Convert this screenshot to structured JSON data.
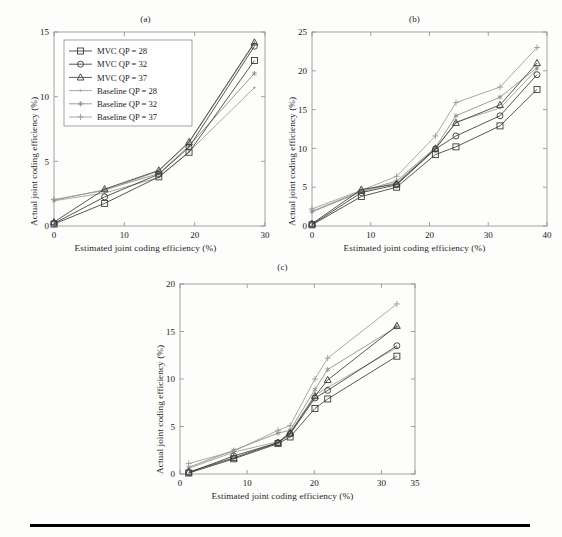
{
  "figure": {
    "background": "#fdfdfc",
    "axis_color": "#8c8c8c",
    "text_color": "#1f1f1f",
    "rule_color": "#000000"
  },
  "series_style": {
    "mvc_color": "#3a3a3a",
    "baseline_color": "#9a9a9a",
    "marker_colors": {
      "square": "#3a3a3a",
      "circle": "#3a3a3a",
      "triangle": "#3a3a3a",
      "dot": "#9a9a9a",
      "asterisk": "#8a8a8a",
      "plus": "#9a9a9a"
    }
  },
  "legend": {
    "position": "upper-left",
    "entries": [
      {
        "label": "MVC QP = 28",
        "marker": "square",
        "color": "#3a3a3a"
      },
      {
        "label": "MVC QP = 32",
        "marker": "circle",
        "color": "#3a3a3a"
      },
      {
        "label": "MVC QP = 37",
        "marker": "triangle",
        "color": "#3a3a3a"
      },
      {
        "label": "Baseline QP = 28",
        "marker": "dot",
        "color": "#9a9a9a"
      },
      {
        "label": "Baseline QP = 32",
        "marker": "asterisk",
        "color": "#8a8a8a"
      },
      {
        "label": "Baseline QP = 37",
        "marker": "plus",
        "color": "#9a9a9a"
      }
    ]
  },
  "chart_data": [
    {
      "type": "line",
      "id": "panel-a",
      "title": "(a)",
      "xlabel": "Estimated joint coding efficiency (%)",
      "ylabel": "Actual joint coding efficiency (%)",
      "xlim": [
        0,
        30
      ],
      "ylim": [
        0,
        15
      ],
      "xticks": [
        0,
        10,
        20,
        30
      ],
      "yticks": [
        0,
        5,
        10,
        15
      ],
      "grid": false,
      "legend": true,
      "series": [
        {
          "name": "MVC QP = 28",
          "marker": "square",
          "color": "#3a3a3a",
          "x": [
            0,
            7.2,
            14.9,
            19.2,
            28.5
          ],
          "y": [
            0.15,
            1.75,
            3.8,
            5.7,
            12.8
          ]
        },
        {
          "name": "MVC QP = 32",
          "marker": "circle",
          "color": "#3a3a3a",
          "x": [
            0,
            7.2,
            14.9,
            19.2,
            28.5
          ],
          "y": [
            0.2,
            2.25,
            4.0,
            6.1,
            13.9
          ]
        },
        {
          "name": "MVC QP = 37",
          "marker": "triangle",
          "color": "#3a3a3a",
          "x": [
            0,
            7.2,
            14.9,
            19.2,
            28.5
          ],
          "y": [
            0.3,
            2.85,
            4.3,
            6.5,
            14.2
          ]
        },
        {
          "name": "Baseline QP = 28",
          "marker": "dot",
          "color": "#9a9a9a",
          "x": [
            0,
            7.2,
            14.9,
            19.2,
            28.5
          ],
          "y": [
            1.95,
            2.55,
            3.75,
            5.75,
            10.7
          ]
        },
        {
          "name": "Baseline QP = 32",
          "marker": "asterisk",
          "color": "#8a8a8a",
          "x": [
            0,
            7.2,
            14.9,
            19.2,
            28.5
          ],
          "y": [
            2.0,
            2.8,
            4.05,
            6.2,
            11.8
          ]
        },
        {
          "name": "Baseline QP = 37",
          "marker": "plus",
          "color": "#9a9a9a",
          "x": [
            0,
            7.2,
            14.9,
            19.2,
            28.5
          ],
          "y": [
            2.05,
            2.75,
            4.25,
            6.45,
            14.1
          ]
        }
      ]
    },
    {
      "type": "line",
      "id": "panel-b",
      "title": "(b)",
      "xlabel": "Estimated joint coding efficiency (%)",
      "ylabel": "Actual joint coding efficiency (%)",
      "xlim": [
        0,
        40
      ],
      "ylim": [
        0,
        25
      ],
      "xticks": [
        0,
        10,
        20,
        30,
        40
      ],
      "yticks": [
        0,
        5,
        10,
        15,
        20,
        25
      ],
      "grid": false,
      "legend": false,
      "series": [
        {
          "name": "MVC QP = 28",
          "marker": "square",
          "color": "#3a3a3a",
          "x": [
            0,
            8.4,
            14.4,
            21.0,
            24.5,
            32.0,
            38.3
          ],
          "y": [
            0.15,
            3.8,
            5.0,
            9.2,
            10.2,
            12.9,
            17.6
          ]
        },
        {
          "name": "MVC QP = 32",
          "marker": "circle",
          "color": "#3a3a3a",
          "x": [
            0,
            8.4,
            14.4,
            21.0,
            24.5,
            32.0,
            38.3
          ],
          "y": [
            0.2,
            4.3,
            5.3,
            9.9,
            11.6,
            14.2,
            19.5
          ]
        },
        {
          "name": "MVC QP = 37",
          "marker": "triangle",
          "color": "#3a3a3a",
          "x": [
            0,
            8.4,
            14.4,
            21.0,
            24.5,
            32.0,
            38.3
          ],
          "y": [
            0.3,
            4.7,
            5.4,
            10.0,
            13.3,
            15.6,
            21.0
          ]
        },
        {
          "name": "Baseline QP = 28",
          "marker": "dot",
          "color": "#9a9a9a",
          "x": [
            0,
            8.4,
            14.4,
            21.0,
            24.5,
            32.0,
            38.3
          ],
          "y": [
            1.8,
            4.4,
            5.6,
            9.9,
            13.4,
            15.2,
            20.2
          ]
        },
        {
          "name": "Baseline QP = 32",
          "marker": "asterisk",
          "color": "#8a8a8a",
          "x": [
            0,
            8.4,
            14.4,
            21.0,
            24.5,
            32.0,
            38.3
          ],
          "y": [
            1.9,
            4.5,
            5.8,
            10.1,
            14.2,
            16.6,
            20.4
          ]
        },
        {
          "name": "Baseline QP = 37",
          "marker": "plus",
          "color": "#9a9a9a",
          "x": [
            0,
            8.4,
            14.4,
            21.0,
            24.5,
            32.0,
            38.3
          ],
          "y": [
            2.2,
            4.6,
            6.4,
            11.6,
            15.9,
            17.9,
            23.0
          ]
        }
      ]
    },
    {
      "type": "line",
      "id": "panel-c",
      "title": "(c)",
      "xlabel": "Estimated joint coding efficiency (%)",
      "ylabel": "Actual joint coding efficiency (%)",
      "xlim": [
        0,
        35
      ],
      "ylim": [
        0,
        20
      ],
      "xticks": [
        0,
        10,
        20,
        30,
        35
      ],
      "yticks": [
        0,
        5,
        10,
        15,
        20
      ],
      "grid": false,
      "legend": false,
      "series": [
        {
          "name": "MVC QP = 28",
          "marker": "square",
          "color": "#3a3a3a",
          "x": [
            1.3,
            8.0,
            14.6,
            16.4,
            20.1,
            22.0,
            32.3
          ],
          "y": [
            0.1,
            1.6,
            3.2,
            3.9,
            6.9,
            7.9,
            12.4
          ]
        },
        {
          "name": "MVC QP = 32",
          "marker": "circle",
          "color": "#3a3a3a",
          "x": [
            1.3,
            8.0,
            14.6,
            16.4,
            20.1,
            22.0,
            32.3
          ],
          "y": [
            0.15,
            1.9,
            3.3,
            4.2,
            8.0,
            8.8,
            13.5
          ]
        },
        {
          "name": "MVC QP = 37",
          "marker": "triangle",
          "color": "#3a3a3a",
          "x": [
            1.3,
            8.0,
            14.6,
            16.4,
            20.1,
            22.0,
            32.3
          ],
          "y": [
            0.2,
            1.7,
            3.3,
            4.3,
            8.2,
            9.9,
            15.6
          ]
        },
        {
          "name": "Baseline QP = 28",
          "marker": "dot",
          "color": "#9a9a9a",
          "x": [
            1.3,
            8.0,
            14.6,
            16.4,
            20.1,
            22.0,
            32.3
          ],
          "y": [
            0.6,
            2.3,
            3.4,
            4.4,
            8.3,
            9.1,
            13.3
          ]
        },
        {
          "name": "Baseline QP = 32",
          "marker": "asterisk",
          "color": "#8a8a8a",
          "x": [
            1.3,
            8.0,
            14.6,
            16.4,
            20.1,
            22.0,
            32.3
          ],
          "y": [
            0.7,
            2.5,
            4.3,
            4.6,
            8.9,
            11.0,
            15.5
          ]
        },
        {
          "name": "Baseline QP = 37",
          "marker": "plus",
          "color": "#9a9a9a",
          "x": [
            1.3,
            8.0,
            14.6,
            16.4,
            20.1,
            22.0,
            32.3
          ],
          "y": [
            1.1,
            2.4,
            4.6,
            5.1,
            10.0,
            12.2,
            17.9
          ]
        }
      ]
    }
  ]
}
